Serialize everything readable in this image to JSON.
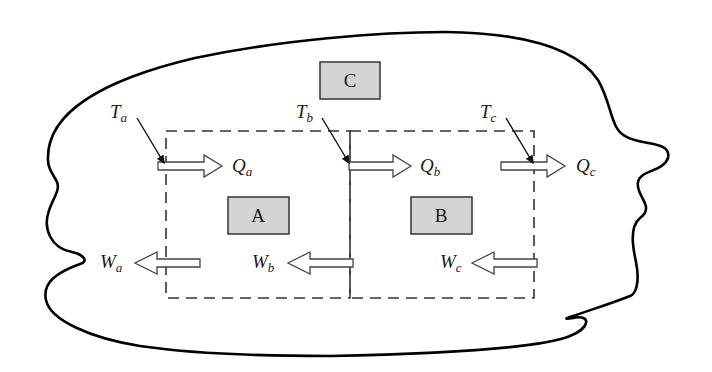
{
  "diagram": {
    "type": "thermodynamic-system-schematic",
    "colors": {
      "background": "#ffffff",
      "outline": "#000000",
      "engine_fill": "#d4d4d4",
      "dashed": "#333333",
      "arrow_fill": "#ffffff"
    },
    "boxes": [
      {
        "id": "C",
        "label": "C"
      },
      {
        "id": "A",
        "label": "A"
      },
      {
        "id": "B",
        "label": "B"
      }
    ],
    "temperatures": [
      {
        "symbol": "T",
        "sub": "a"
      },
      {
        "symbol": "T",
        "sub": "b"
      },
      {
        "symbol": "T",
        "sub": "c"
      }
    ],
    "heat_flows": [
      {
        "symbol": "Q",
        "sub": "a",
        "direction": "right"
      },
      {
        "symbol": "Q",
        "sub": "b",
        "direction": "right"
      },
      {
        "symbol": "Q",
        "sub": "c",
        "direction": "right"
      }
    ],
    "work_flows": [
      {
        "symbol": "W",
        "sub": "a",
        "direction": "left"
      },
      {
        "symbol": "W",
        "sub": "b",
        "direction": "left"
      },
      {
        "symbol": "W",
        "sub": "c",
        "direction": "left"
      }
    ],
    "regions": [
      {
        "id": "region-A",
        "style": "dashed",
        "contains": "A"
      },
      {
        "id": "region-B",
        "style": "dashed",
        "contains": "B"
      }
    ]
  }
}
